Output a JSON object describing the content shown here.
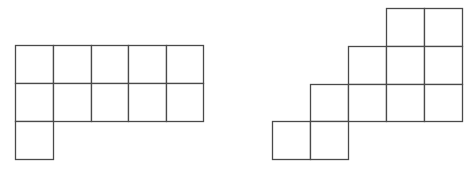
{
  "diagram": {
    "stroke_color": "#4a4a4a",
    "background": "#ffffff",
    "figures": [
      {
        "name": "figure-left",
        "description": "2x5 grid of squares with one extra square below the leftmost column",
        "cell_count": 11,
        "cells": [
          {
            "x": 15,
            "y": 45,
            "w": 38,
            "h": 38
          },
          {
            "x": 53,
            "y": 45,
            "w": 38,
            "h": 38
          },
          {
            "x": 91,
            "y": 45,
            "w": 37,
            "h": 38
          },
          {
            "x": 128,
            "y": 45,
            "w": 38,
            "h": 38
          },
          {
            "x": 166,
            "y": 45,
            "w": 37,
            "h": 38
          },
          {
            "x": 15,
            "y": 83,
            "w": 38,
            "h": 38
          },
          {
            "x": 53,
            "y": 83,
            "w": 38,
            "h": 38
          },
          {
            "x": 91,
            "y": 83,
            "w": 37,
            "h": 38
          },
          {
            "x": 128,
            "y": 83,
            "w": 38,
            "h": 38
          },
          {
            "x": 166,
            "y": 83,
            "w": 37,
            "h": 38
          },
          {
            "x": 15,
            "y": 121,
            "w": 38,
            "h": 38
          }
        ]
      },
      {
        "name": "figure-right",
        "description": "Staircase arrangement of squares rising to the right",
        "cell_count": 11,
        "cells": [
          {
            "x": 386,
            "y": 8,
            "w": 38,
            "h": 38
          },
          {
            "x": 424,
            "y": 8,
            "w": 38,
            "h": 38
          },
          {
            "x": 348,
            "y": 46,
            "w": 38,
            "h": 38
          },
          {
            "x": 386,
            "y": 46,
            "w": 38,
            "h": 38
          },
          {
            "x": 424,
            "y": 46,
            "w": 38,
            "h": 38
          },
          {
            "x": 310,
            "y": 84,
            "w": 38,
            "h": 37
          },
          {
            "x": 348,
            "y": 84,
            "w": 38,
            "h": 37
          },
          {
            "x": 386,
            "y": 84,
            "w": 38,
            "h": 37
          },
          {
            "x": 424,
            "y": 84,
            "w": 38,
            "h": 37
          },
          {
            "x": 272,
            "y": 121,
            "w": 38,
            "h": 38
          },
          {
            "x": 310,
            "y": 121,
            "w": 38,
            "h": 38
          }
        ]
      }
    ]
  }
}
